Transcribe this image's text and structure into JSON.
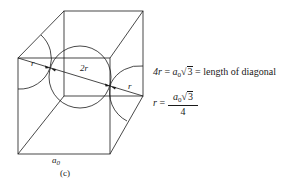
{
  "figure": {
    "caption": "(c)",
    "edge_label": "a",
    "edge_label_sub": "0",
    "radius_label": "r",
    "diameter_label": "2r",
    "line_color": "#1a1a1a"
  },
  "equations": {
    "eq1_lhs": "4r",
    "eq1_eq": "=",
    "eq1_a": "a",
    "eq1_a_sub": "0",
    "eq1_root_sign": "√",
    "eq1_root": "3",
    "eq1_eq2": "=",
    "eq1_rhs": "length of diagonal",
    "eq2_lhs": "r",
    "eq2_eq": "=",
    "eq2_num_a": "a",
    "eq2_num_sub": "0",
    "eq2_root_sign": "√",
    "eq2_root": "3",
    "eq2_den": "4"
  }
}
